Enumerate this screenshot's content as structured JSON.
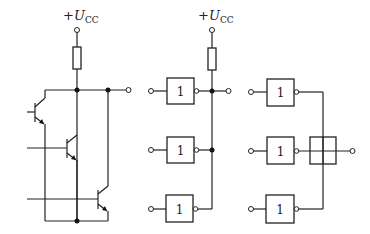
{
  "diagram": {
    "type": "circuit",
    "supply_label": {
      "prefix": "+",
      "symbol": "U",
      "subscript": "CC"
    },
    "sections": [
      {
        "name": "transistor-wired-or",
        "components": [
          "resistor",
          "transistor-1",
          "transistor-2",
          "transistor-3"
        ]
      },
      {
        "name": "gate-wired-and-with-pullup",
        "gates": [
          {
            "label": "1"
          },
          {
            "label": "1"
          },
          {
            "label": "1"
          }
        ]
      },
      {
        "name": "wired-logic-symbol",
        "gates": [
          {
            "label": "1"
          },
          {
            "label": "1"
          },
          {
            "label": "1"
          }
        ]
      }
    ],
    "gate_label": "1"
  }
}
